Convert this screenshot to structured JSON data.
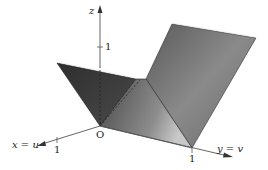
{
  "figure": {
    "type": "3d-surface-diagram",
    "axes": {
      "z": {
        "label": "z",
        "tick_label": "1"
      },
      "x": {
        "label": "x = u",
        "tick_label": "1"
      },
      "y": {
        "label": "y = v",
        "tick_label": "1"
      },
      "origin_label": "O"
    },
    "colors": {
      "surface_dark": "#3a3a3a",
      "surface_mid": "#6e6e6e",
      "surface_light": "#bdbdbd",
      "axis": "#555555",
      "edge": "#222222"
    }
  }
}
